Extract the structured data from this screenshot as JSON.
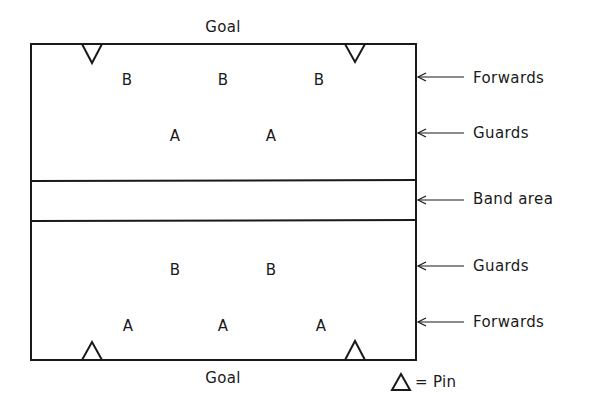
{
  "diagram": {
    "goals": {
      "top": "Goal",
      "bottom": "Goal"
    },
    "court": {
      "line_color": "#1a1a1a",
      "left": 31,
      "top": 44,
      "right": 416,
      "bottom": 360,
      "band_top": 180,
      "band_bottom": 220
    },
    "players": {
      "top_half": {
        "forwards": [
          "B",
          "B",
          "B"
        ],
        "guards": [
          "A",
          "A"
        ]
      },
      "bottom_half": {
        "guards": [
          "B",
          "B"
        ],
        "forwards": [
          "A",
          "A",
          "A"
        ]
      }
    },
    "side_labels": [
      {
        "id": "forwards-top",
        "label": "Forwards"
      },
      {
        "id": "guards-top",
        "label": "Guards"
      },
      {
        "id": "band-area",
        "label": "Band area"
      },
      {
        "id": "guards-bottom",
        "label": "Guards"
      },
      {
        "id": "forwards-bottom",
        "label": "Forwards"
      }
    ],
    "legend": {
      "symbol": "triangle",
      "equals": "=",
      "label": "Pin",
      "text": "= Pin"
    }
  }
}
